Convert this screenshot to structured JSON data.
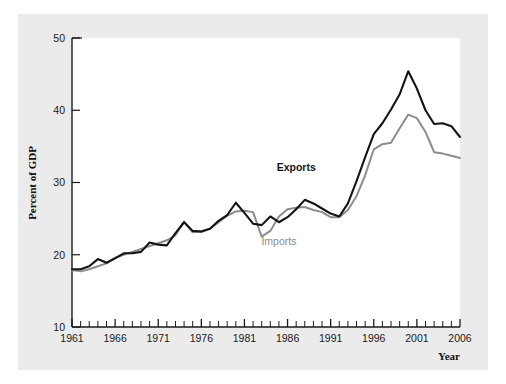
{
  "figure": {
    "background_color": "#ffffff",
    "panel_color": "#ebebeb",
    "plot_color": "#ffffff"
  },
  "chart_data": {
    "type": "line",
    "title": "",
    "xlabel": "Year",
    "ylabel": "Percent of GDP",
    "xlim": [
      1961,
      2006
    ],
    "ylim": [
      10,
      50
    ],
    "yticks": [
      10,
      20,
      30,
      40,
      50
    ],
    "ytick_labels": [
      "10",
      "20",
      "30",
      "40",
      "50"
    ],
    "xticks": [
      1961,
      1966,
      1971,
      1976,
      1981,
      1986,
      1991,
      1996,
      2001,
      2006
    ],
    "xtick_labels": [
      "1961",
      "1966",
      "1971",
      "1976",
      "1981",
      "1986",
      "1991",
      "1996",
      "2001",
      "2006"
    ],
    "minor_xtick_interval": 1,
    "grid": false,
    "legend_position": "inline-annotation",
    "x": [
      1961,
      1962,
      1963,
      1964,
      1965,
      1966,
      1967,
      1968,
      1969,
      1970,
      1971,
      1972,
      1973,
      1974,
      1975,
      1976,
      1977,
      1978,
      1979,
      1980,
      1981,
      1982,
      1983,
      1984,
      1985,
      1986,
      1987,
      1988,
      1989,
      1990,
      1991,
      1992,
      1993,
      1994,
      1995,
      1996,
      1997,
      1998,
      1999,
      2000,
      2001,
      2002,
      2003,
      2004,
      2005,
      2006
    ],
    "series": [
      {
        "name": "Exports",
        "color": "#141414",
        "label_x": 1987,
        "label_y": 31.6,
        "values": [
          18.0,
          18.0,
          18.4,
          19.4,
          18.9,
          19.5,
          20.2,
          20.2,
          20.4,
          21.7,
          21.4,
          21.3,
          23.0,
          24.5,
          23.3,
          23.2,
          23.6,
          24.7,
          25.5,
          27.2,
          25.8,
          24.3,
          24.1,
          25.3,
          24.5,
          25.2,
          26.3,
          27.6,
          27.1,
          26.4,
          25.7,
          25.3,
          27.1,
          30.2,
          33.5,
          36.7,
          38.2,
          40.1,
          42.2,
          45.4,
          43.0,
          40.0,
          38.1,
          38.2,
          37.8,
          36.3
        ]
      },
      {
        "name": "Imports",
        "color": "#8c8c8c",
        "label_x": 1985,
        "label_y": 21.3,
        "values": [
          17.9,
          17.7,
          18.0,
          18.4,
          18.8,
          19.6,
          20.0,
          20.4,
          20.8,
          21.2,
          21.6,
          22.0,
          22.7,
          24.6,
          23.1,
          23.3,
          23.6,
          24.5,
          25.4,
          26.0,
          26.1,
          25.9,
          22.5,
          23.3,
          25.3,
          26.3,
          26.5,
          26.6,
          26.2,
          25.9,
          25.2,
          25.2,
          26.2,
          28.1,
          31.0,
          34.6,
          35.3,
          35.5,
          37.5,
          39.4,
          38.9,
          37.0,
          34.2,
          34.0,
          33.7,
          33.4
        ]
      }
    ]
  }
}
